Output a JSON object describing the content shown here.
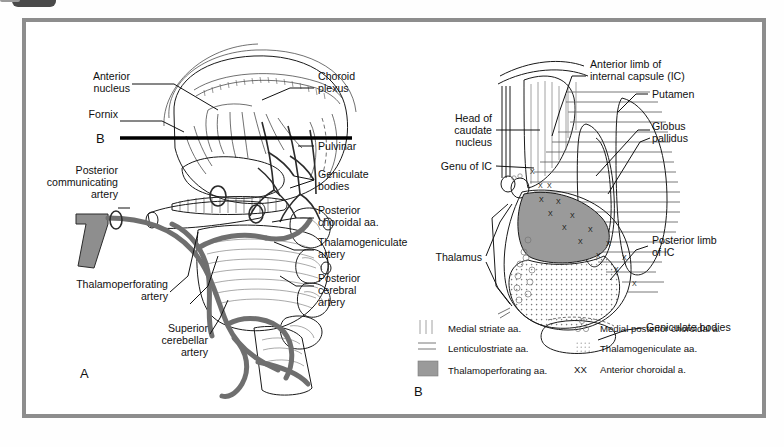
{
  "figure": {
    "panels": [
      {
        "letter": "A",
        "name": "sagittal-thalamus-arterial-supply"
      },
      {
        "letter": "B",
        "name": "axial-internal-capsule-arterial-territories"
      }
    ],
    "section_marker": "B"
  },
  "panelA": {
    "letter": "A",
    "labels": [
      {
        "id": "anterior-nucleus",
        "lines": [
          "Anterior",
          "nucleus"
        ]
      },
      {
        "id": "fornix",
        "lines": [
          "Fornix"
        ]
      },
      {
        "id": "choroid-plexus",
        "lines": [
          "Choroid",
          "plexus"
        ]
      },
      {
        "id": "pulvinar",
        "lines": [
          "Pulvinar"
        ]
      },
      {
        "id": "geniculate-bodies",
        "lines": [
          "Geniculate",
          "bodies"
        ]
      },
      {
        "id": "posterior-communicating-artery",
        "lines": [
          "Posterior",
          "communicating",
          "artery"
        ]
      },
      {
        "id": "posterior-choroidal-aa",
        "lines": [
          "Posterior",
          "choroidal aa."
        ]
      },
      {
        "id": "thalamogeniculate-artery",
        "lines": [
          "Thalamogeniculate",
          "artery"
        ]
      },
      {
        "id": "posterior-cerebral-artery",
        "lines": [
          "Posterior",
          "cerebral",
          "artery"
        ]
      },
      {
        "id": "thalamoperforating-artery",
        "lines": [
          "Thalamoperforating",
          "artery"
        ]
      },
      {
        "id": "superior-cerebellar-artery",
        "lines": [
          "Superior",
          "cerebellar",
          "artery"
        ]
      }
    ]
  },
  "panelB": {
    "letter": "B",
    "labels": [
      {
        "id": "anterior-limb-internal-capsule",
        "lines": [
          "Anterior limb of",
          "internal capsule (IC)"
        ]
      },
      {
        "id": "putamen",
        "lines": [
          "Putamen"
        ]
      },
      {
        "id": "globus-pallidus",
        "lines": [
          "Globus",
          "pallidus"
        ]
      },
      {
        "id": "head-of-caudate-nucleus",
        "lines": [
          "Head of",
          "caudate",
          "nucleus"
        ]
      },
      {
        "id": "genu-of-ic",
        "lines": [
          "Genu of IC"
        ]
      },
      {
        "id": "thalamus",
        "lines": [
          "Thalamus"
        ]
      },
      {
        "id": "posterior-limb-of-ic",
        "lines": [
          "Posterior limb",
          "of IC"
        ]
      },
      {
        "id": "geniculate-bodies",
        "lines": [
          "Geniculate bodies"
        ]
      }
    ]
  },
  "legend": {
    "left_column": [
      {
        "swatch": "vertical-lines",
        "label": "Medial striate aa."
      },
      {
        "swatch": "horizontal-lines",
        "label": "Lenticulostriate aa."
      },
      {
        "swatch": "solid-gray",
        "label": "Thalamoperforating aa."
      }
    ],
    "right_column": [
      {
        "swatch": "small-circles",
        "label": "Medial posterior choroidal a."
      },
      {
        "swatch": "fine-dots",
        "label": "Thalamogeniculate aa."
      },
      {
        "swatch": "xx-marks",
        "label": "Anterior choroidal a."
      }
    ]
  },
  "colors": {
    "frame": "#8d8d8d",
    "artery_fill": "#8e8e8e",
    "thalamoperforating_gray": "#9a9a9a",
    "ink": "#111111",
    "background": "#ffffff"
  }
}
